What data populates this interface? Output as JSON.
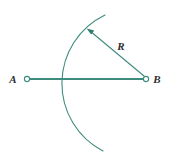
{
  "figure": {
    "background_color": "#ffffff",
    "stroke_color": "#3d8b7d",
    "label_color": "#2e2e2e",
    "width": 172,
    "height": 161
  },
  "labels": {
    "point_a": "A",
    "point_b": "B",
    "radius": "R"
  },
  "geometry": {
    "point_a": {
      "x": 27,
      "y": 79
    },
    "point_b": {
      "x": 146,
      "y": 79
    },
    "segment_ab": {
      "x1": 27,
      "y1": 79,
      "x2": 146,
      "y2": 79
    },
    "radius_length": 76,
    "arc": {
      "center_x": 146,
      "center_y": 79,
      "radius": 76,
      "start_x": 105,
      "start_y": 15,
      "end_x": 103,
      "end_y": 151,
      "leftmost_x": 70,
      "leftmost_y": 79
    },
    "radius_arrow": {
      "from_x": 144,
      "from_y": 76,
      "to_x": 88,
      "to_y": 30
    },
    "label_positions": {
      "point_a": {
        "x": 13,
        "y": 83
      },
      "point_b": {
        "x": 154,
        "y": 83
      },
      "radius": {
        "x": 119,
        "y": 50
      }
    },
    "marker_radius": 2.6
  }
}
